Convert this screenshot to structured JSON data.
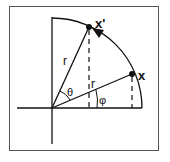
{
  "diagram": {
    "labels": {
      "point_rotated": "x'",
      "point_original": "x",
      "radius_rotated": "r",
      "radius_original": "r",
      "angle_rotation": "θ",
      "angle_original": "φ"
    },
    "colors": {
      "stroke": "#111111",
      "frame": "#555555",
      "background": "#ffffff"
    }
  }
}
